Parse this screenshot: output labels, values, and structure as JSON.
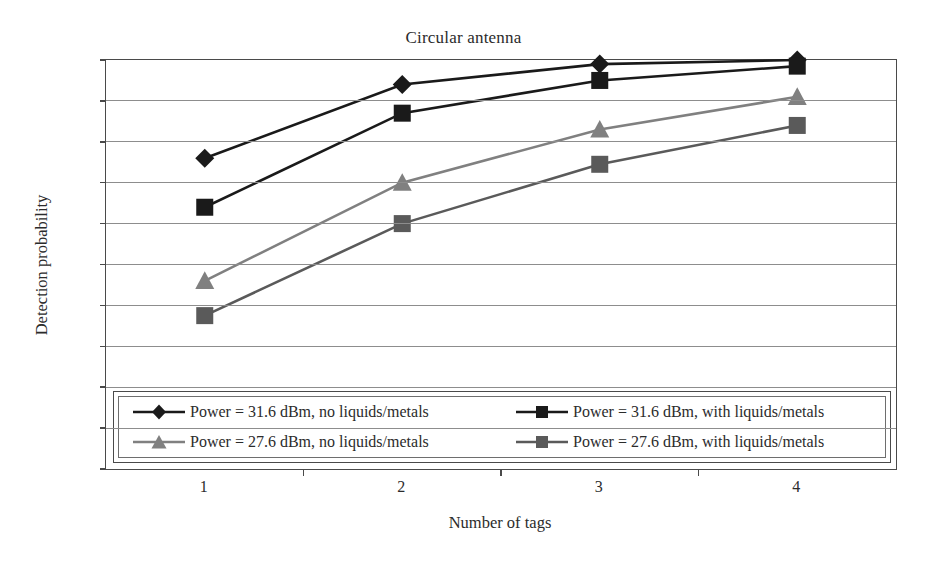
{
  "chart_data": {
    "type": "line",
    "title": "Circular antenna",
    "xlabel": "Number of tags",
    "ylabel": "Detection probability",
    "categories": [
      "1",
      "2",
      "3",
      "4"
    ],
    "x_tick_labels": [
      "1",
      "2",
      "3",
      "4"
    ],
    "y_tick_labels": [
      "1",
      "0.9",
      "0.8",
      "0.7",
      "0.6",
      "0.5",
      "0.4",
      "0.3",
      "0.2",
      "0.1",
      "0"
    ],
    "y_tick_values": [
      1,
      0.9,
      0.8,
      0.7,
      0.6,
      0.5,
      0.4,
      0.3,
      0.2,
      0.1,
      0
    ],
    "ylim": [
      0,
      1
    ],
    "grid": "horizontal",
    "legend_position": "inside-bottom-left",
    "series": [
      {
        "name": "Power = 31.6 dBm, no liquids/metals",
        "marker": "diamond",
        "color": "#1a1a1a",
        "values": [
          0.76,
          0.94,
          0.99,
          1.0
        ]
      },
      {
        "name": "Power = 31.6 dBm, with liquids/metals",
        "marker": "square",
        "color": "#1a1a1a",
        "values": [
          0.64,
          0.87,
          0.95,
          0.985
        ]
      },
      {
        "name": "Power = 27.6 dBm, no liquids/metals",
        "marker": "triangle",
        "color": "#808080",
        "values": [
          0.46,
          0.7,
          0.83,
          0.91
        ]
      },
      {
        "name": "Power = 27.6 dBm, with liquids/metals",
        "marker": "square",
        "color": "#5a5a5a",
        "values": [
          0.375,
          0.6,
          0.745,
          0.84
        ]
      }
    ]
  },
  "legend": {
    "entries": [
      "Power = 31.6 dBm, no liquids/metals",
      "Power = 31.6 dBm, with liquids/metals",
      "Power = 27.6 dBm, no liquids/metals",
      "Power = 27.6 dBm, with liquids/metals"
    ]
  }
}
